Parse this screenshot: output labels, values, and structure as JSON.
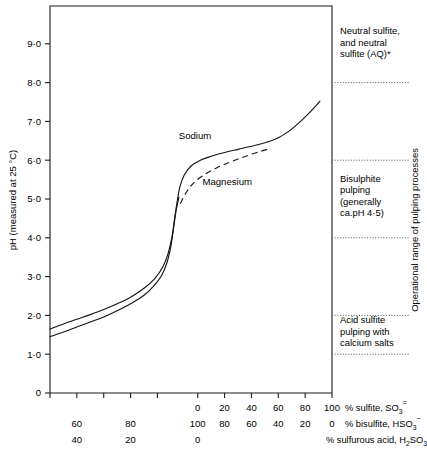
{
  "chart_data": {
    "type": "line",
    "title": "",
    "ylabel": "pH (measured at 25 °C)",
    "ylim": [
      0,
      9.8
    ],
    "yticks": [
      0,
      1.0,
      2.0,
      3.0,
      4.0,
      5.0,
      6.0,
      7.0,
      8.0,
      9.0
    ],
    "ytick_labels": [
      "0",
      "1·0",
      "2·0",
      "3·0",
      "4·0",
      "5·0",
      "6·0",
      "7·0",
      "8·0",
      "9·0"
    ],
    "grid": false,
    "legend_position": "inline-annotation",
    "xlim": [
      -110,
      100
    ],
    "xticks": [
      -110,
      -90,
      -70,
      -50,
      -30,
      0,
      20,
      40,
      60,
      80,
      100
    ],
    "x_axis_rows": [
      {
        "name": "% sulfite, SO3 (2-)",
        "label_main": "% sulfite, SO",
        "label_sub": "3",
        "label_sup": "=",
        "ticks": [
          {
            "x": -110,
            "label": ""
          },
          {
            "x": -90,
            "label": ""
          },
          {
            "x": -70,
            "label": ""
          },
          {
            "x": -50,
            "label": ""
          },
          {
            "x": -30,
            "label": ""
          },
          {
            "x": 0,
            "label": "0"
          },
          {
            "x": 20,
            "label": "20"
          },
          {
            "x": 40,
            "label": "40"
          },
          {
            "x": 60,
            "label": "60"
          },
          {
            "x": 80,
            "label": "80"
          },
          {
            "x": 100,
            "label": "100"
          }
        ]
      },
      {
        "name": "% bisulfite, HSO3 (-)",
        "label_main": "% bisulfite, HSO",
        "label_sub": "3",
        "label_sup": "−",
        "ticks": [
          {
            "x": -110,
            "label": ""
          },
          {
            "x": -90,
            "label": "60"
          },
          {
            "x": -70,
            "label": ""
          },
          {
            "x": -50,
            "label": "80"
          },
          {
            "x": -30,
            "label": ""
          },
          {
            "x": 0,
            "label": "100"
          },
          {
            "x": 20,
            "label": "80"
          },
          {
            "x": 40,
            "label": "60"
          },
          {
            "x": 60,
            "label": "40"
          },
          {
            "x": 80,
            "label": "20"
          },
          {
            "x": 100,
            "label": "0"
          }
        ]
      },
      {
        "name": "% sulfurous acid, H2SO3",
        "label_main": "% sulfurous acid, H",
        "label_sub": "2",
        "label_tail": "SO",
        "label_sub2": "3",
        "ticks": [
          {
            "x": -110,
            "label": ""
          },
          {
            "x": -90,
            "label": "40"
          },
          {
            "x": -70,
            "label": ""
          },
          {
            "x": -50,
            "label": "20"
          },
          {
            "x": -30,
            "label": ""
          },
          {
            "x": 0,
            "label": "0"
          },
          {
            "x": 20,
            "label": ""
          },
          {
            "x": 40,
            "label": ""
          },
          {
            "x": 60,
            "label": ""
          },
          {
            "x": 80,
            "label": ""
          },
          {
            "x": 100,
            "label": ""
          }
        ]
      }
    ],
    "series": [
      {
        "name": "Sodium",
        "style": "solid",
        "label": "Sodium",
        "points": [
          [
            -110,
            1.65
          ],
          [
            -100,
            1.78
          ],
          [
            -90,
            1.9
          ],
          [
            -80,
            2.02
          ],
          [
            -70,
            2.15
          ],
          [
            -60,
            2.3
          ],
          [
            -50,
            2.47
          ],
          [
            -40,
            2.7
          ],
          [
            -32,
            2.95
          ],
          [
            -26,
            3.25
          ],
          [
            -22,
            3.6
          ],
          [
            -19,
            4.05
          ],
          [
            -17,
            4.55
          ],
          [
            -15,
            5.0
          ],
          [
            -13,
            5.35
          ],
          [
            -10,
            5.62
          ],
          [
            -5,
            5.85
          ],
          [
            2,
            6.0
          ],
          [
            10,
            6.1
          ],
          [
            20,
            6.2
          ],
          [
            30,
            6.28
          ],
          [
            40,
            6.36
          ],
          [
            50,
            6.45
          ],
          [
            60,
            6.58
          ],
          [
            68,
            6.75
          ],
          [
            76,
            6.98
          ],
          [
            82,
            7.18
          ],
          [
            88,
            7.4
          ],
          [
            91,
            7.52
          ]
        ]
      },
      {
        "name": "Calcium-lower",
        "style": "solid",
        "label": "",
        "points": [
          [
            -110,
            1.45
          ],
          [
            -100,
            1.57
          ],
          [
            -90,
            1.7
          ],
          [
            -80,
            1.83
          ],
          [
            -70,
            1.96
          ],
          [
            -60,
            2.12
          ],
          [
            -50,
            2.3
          ],
          [
            -40,
            2.52
          ],
          [
            -33,
            2.75
          ],
          [
            -27,
            3.02
          ],
          [
            -23,
            3.35
          ],
          [
            -20,
            3.78
          ],
          [
            -18,
            4.25
          ],
          [
            -16,
            4.72
          ],
          [
            -14,
            5.05
          ]
        ]
      },
      {
        "name": "Magnesium",
        "style": "dashed",
        "label": "Magnesium",
        "points": [
          [
            -13,
            4.88
          ],
          [
            -8,
            5.2
          ],
          [
            -2,
            5.45
          ],
          [
            6,
            5.65
          ],
          [
            14,
            5.8
          ],
          [
            22,
            5.92
          ],
          [
            30,
            6.03
          ],
          [
            38,
            6.13
          ],
          [
            46,
            6.22
          ],
          [
            52,
            6.28
          ]
        ]
      }
    ],
    "curve_labels": [
      {
        "text": "Sodium",
        "x": -2,
        "y": 6.55
      },
      {
        "text": "Magnesium",
        "x": 22,
        "y": 5.35
      }
    ],
    "band_dividers": [
      {
        "ph": 8.0
      },
      {
        "ph": 6.0
      },
      {
        "ph": 4.0
      },
      {
        "ph": 2.0
      },
      {
        "ph": 1.0
      }
    ],
    "annotations": [
      {
        "name": "neutral-sulfite-band",
        "lines": [
          "Neutral sulfite,",
          "and neutral",
          "sulfite (AQ)*"
        ],
        "ph_center": 8.95
      },
      {
        "name": "bisulphite-band",
        "lines": [
          "Bisulphite",
          "pulping",
          "(generally",
          "ca.pH 4·5)"
        ],
        "ph_center": 5.0
      },
      {
        "name": "acid-sulfite-band",
        "lines": [
          "Acid sulfite",
          "pulping with",
          "calcium salts"
        ],
        "ph_center": 1.5
      }
    ],
    "side_label": "Operational range of pulping processes"
  },
  "colors": {
    "ink": "#141414",
    "axis": "#1a1a1a",
    "divider": "#555555",
    "background": "#ffffff"
  }
}
